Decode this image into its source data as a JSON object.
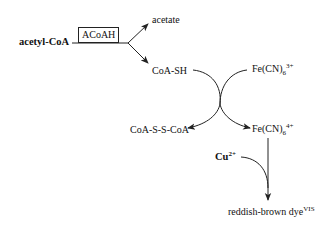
{
  "diagram": {
    "type": "reaction-scheme",
    "substrate": {
      "label": "acetyl-CoA",
      "bold": true
    },
    "enzyme": {
      "label": "ACoAH",
      "boxed": true
    },
    "products": {
      "acetate": "acetate",
      "coash": "CoA-SH"
    },
    "redox": {
      "ferricyanide": {
        "base": "Fe(CN)",
        "sub": "6",
        "sup": "3+"
      },
      "disulfide": "CoA-S-S-CoA",
      "ferrocyanide": {
        "base": "Fe(CN)",
        "sub": "6",
        "sup": "4+"
      }
    },
    "detection": {
      "copper": {
        "base": "Cu",
        "sup": "2+",
        "bold": true
      },
      "dye": {
        "base": "reddish-brown dye",
        "sup": "VIS"
      }
    },
    "colors": {
      "line": "#222222",
      "text": "#111111",
      "background": "#ffffff"
    }
  }
}
